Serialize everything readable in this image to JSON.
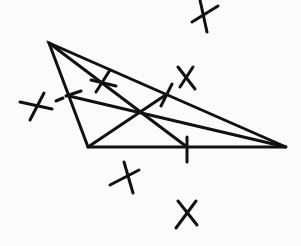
{
  "diagram": {
    "stroke_color": "#111111",
    "background_color": "#fbfbfb",
    "stroke_width": 3,
    "vertices": {
      "A": [
        49,
        43
      ],
      "B": [
        88,
        147
      ],
      "C": [
        286,
        147
      ]
    },
    "midpoints": {
      "AB": [
        69,
        96
      ],
      "BC": [
        187,
        147
      ],
      "AC": [
        167,
        94
      ]
    },
    "centroid": [
      141,
      113
    ],
    "medians": [
      {
        "from": "A",
        "to": "BC",
        "x1": 49,
        "y1": 43,
        "x2": 187,
        "y2": 147
      },
      {
        "from": "B",
        "to": "AC",
        "x1": 88,
        "y1": 147,
        "x2": 167,
        "y2": 94
      },
      {
        "from": "C",
        "to": "AB",
        "x1": 286,
        "y1": 147,
        "x2": 69,
        "y2": 96
      }
    ],
    "midpoint_ticks": [
      {
        "x1": 187,
        "y1": 137,
        "x2": 187,
        "y2": 162
      },
      {
        "x1": 161,
        "y1": 106,
        "x2": 172,
        "y2": 84
      },
      {
        "x1": 56,
        "y1": 101,
        "x2": 63,
        "y2": 98
      },
      {
        "x1": 66,
        "y1": 96,
        "x2": 81,
        "y2": 91
      }
    ],
    "arc_marks": [
      {
        "name": "arc-mark-top",
        "lines": [
          [
            200,
            0,
            207,
            32
          ],
          [
            192,
            22,
            218,
            6
          ]
        ]
      },
      {
        "name": "arc-mark-upper-right",
        "lines": [
          [
            178,
            67,
            195,
            89
          ],
          [
            193,
            67,
            180,
            87
          ]
        ]
      },
      {
        "name": "arc-mark-on-ac",
        "lines": [
          [
            91,
            80,
            116,
            86
          ],
          [
            96,
            92,
            110,
            70
          ]
        ]
      },
      {
        "name": "arc-mark-left",
        "lines": [
          [
            20,
            102,
            52,
            109
          ],
          [
            30,
            120,
            44,
            93
          ]
        ]
      },
      {
        "name": "arc-mark-lower-left",
        "lines": [
          [
            124,
            162,
            133,
            193
          ],
          [
            110,
            185,
            139,
            170
          ]
        ]
      },
      {
        "name": "arc-mark-bottom",
        "lines": [
          [
            178,
            201,
            197,
            225
          ],
          [
            196,
            201,
            176,
            228
          ]
        ]
      }
    ]
  }
}
